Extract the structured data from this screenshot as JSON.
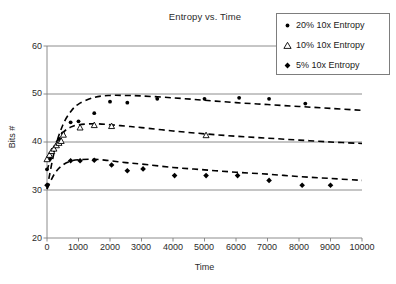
{
  "chart_data": {
    "type": "scatter",
    "title": "Entropy vs. Time",
    "xlabel": "Time",
    "ylabel": "Bits #",
    "xlim": [
      0,
      10000
    ],
    "ylim": [
      20,
      60
    ],
    "xticks": [
      0,
      1000,
      2000,
      3000,
      4000,
      5000,
      6000,
      7000,
      8000,
      9000,
      10000
    ],
    "yticks": [
      20,
      30,
      40,
      50,
      60
    ],
    "grid": "horizontal",
    "legend_position": "top-right",
    "series": [
      {
        "name": "20% 10x Entropy",
        "marker": "filled-circle",
        "points": [
          {
            "x": 0,
            "y": 34.3
          },
          {
            "x": 100,
            "y": 36.5
          },
          {
            "x": 200,
            "y": 38.2
          },
          {
            "x": 300,
            "y": 39.4
          },
          {
            "x": 400,
            "y": 40.6
          },
          {
            "x": 500,
            "y": 41.8
          },
          {
            "x": 750,
            "y": 44.1
          },
          {
            "x": 1000,
            "y": 44.3
          },
          {
            "x": 1500,
            "y": 46.0
          },
          {
            "x": 2000,
            "y": 48.4
          },
          {
            "x": 2550,
            "y": 48.2
          },
          {
            "x": 3500,
            "y": 49.0
          },
          {
            "x": 5000,
            "y": 49.0
          },
          {
            "x": 6100,
            "y": 49.2
          },
          {
            "x": 7050,
            "y": 49.0
          },
          {
            "x": 8200,
            "y": 48.0
          }
        ],
        "fit_curve": [
          {
            "x": 0,
            "y": 30.3
          },
          {
            "x": 250,
            "y": 38.5
          },
          {
            "x": 500,
            "y": 43.5
          },
          {
            "x": 750,
            "y": 46.3
          },
          {
            "x": 1000,
            "y": 47.9
          },
          {
            "x": 1500,
            "y": 49.3
          },
          {
            "x": 2000,
            "y": 49.7
          },
          {
            "x": 2500,
            "y": 49.7
          },
          {
            "x": 3000,
            "y": 49.6
          },
          {
            "x": 4000,
            "y": 49.2
          },
          {
            "x": 5000,
            "y": 48.7
          },
          {
            "x": 6000,
            "y": 48.2
          },
          {
            "x": 7000,
            "y": 47.8
          },
          {
            "x": 8000,
            "y": 47.4
          },
          {
            "x": 9000,
            "y": 47.0
          },
          {
            "x": 10000,
            "y": 46.6
          }
        ]
      },
      {
        "name": "10% 10x Entropy",
        "marker": "open-triangle",
        "points": [
          {
            "x": 0,
            "y": 36.4
          },
          {
            "x": 80,
            "y": 37.3
          },
          {
            "x": 150,
            "y": 38.1
          },
          {
            "x": 220,
            "y": 38.6
          },
          {
            "x": 300,
            "y": 39.3
          },
          {
            "x": 380,
            "y": 39.8
          },
          {
            "x": 450,
            "y": 40.2
          },
          {
            "x": 520,
            "y": 41.5
          },
          {
            "x": 1050,
            "y": 43.0
          },
          {
            "x": 1500,
            "y": 43.5
          },
          {
            "x": 2050,
            "y": 43.3
          },
          {
            "x": 5050,
            "y": 41.4
          }
        ],
        "fit_curve": [
          {
            "x": 0,
            "y": 34.0
          },
          {
            "x": 250,
            "y": 39.3
          },
          {
            "x": 500,
            "y": 41.9
          },
          {
            "x": 750,
            "y": 43.1
          },
          {
            "x": 1000,
            "y": 43.6
          },
          {
            "x": 1500,
            "y": 43.8
          },
          {
            "x": 2000,
            "y": 43.6
          },
          {
            "x": 2500,
            "y": 43.3
          },
          {
            "x": 3000,
            "y": 43.0
          },
          {
            "x": 4000,
            "y": 42.3
          },
          {
            "x": 5000,
            "y": 41.7
          },
          {
            "x": 6000,
            "y": 41.2
          },
          {
            "x": 7000,
            "y": 40.8
          },
          {
            "x": 8000,
            "y": 40.4
          },
          {
            "x": 9000,
            "y": 40.0
          },
          {
            "x": 10000,
            "y": 39.7
          }
        ]
      },
      {
        "name": "5% 10x Entropy",
        "marker": "filled-diamond",
        "points": [
          {
            "x": 0,
            "y": 31.0
          },
          {
            "x": 750,
            "y": 36.1
          },
          {
            "x": 1050,
            "y": 36.1
          },
          {
            "x": 1500,
            "y": 36.2
          },
          {
            "x": 2050,
            "y": 35.2
          },
          {
            "x": 2550,
            "y": 34.0
          },
          {
            "x": 3050,
            "y": 34.4
          },
          {
            "x": 4050,
            "y": 33.0
          },
          {
            "x": 5050,
            "y": 33.0
          },
          {
            "x": 6050,
            "y": 33.0
          },
          {
            "x": 7050,
            "y": 32.0
          },
          {
            "x": 8100,
            "y": 31.0
          },
          {
            "x": 9000,
            "y": 31.0
          }
        ],
        "fit_curve": [
          {
            "x": 0,
            "y": 30.2
          },
          {
            "x": 250,
            "y": 33.5
          },
          {
            "x": 500,
            "y": 35.2
          },
          {
            "x": 750,
            "y": 36.0
          },
          {
            "x": 1000,
            "y": 36.3
          },
          {
            "x": 1500,
            "y": 36.4
          },
          {
            "x": 2000,
            "y": 36.1
          },
          {
            "x": 2500,
            "y": 35.7
          },
          {
            "x": 3000,
            "y": 35.4
          },
          {
            "x": 4000,
            "y": 34.7
          },
          {
            "x": 5000,
            "y": 34.2
          },
          {
            "x": 6000,
            "y": 33.7
          },
          {
            "x": 7000,
            "y": 33.3
          },
          {
            "x": 8000,
            "y": 32.8
          },
          {
            "x": 9000,
            "y": 32.4
          },
          {
            "x": 10000,
            "y": 32.0
          }
        ]
      }
    ]
  },
  "legend": {
    "items": [
      {
        "label": "20% 10x Entropy",
        "marker": "filled-circle"
      },
      {
        "label": "10% 10x Entropy",
        "marker": "open-triangle"
      },
      {
        "label": "5% 10x Entropy",
        "marker": "filled-diamond"
      }
    ]
  },
  "axes": {
    "y_tick_labels": [
      "60",
      "50",
      "40",
      "30",
      "20"
    ],
    "x_tick_labels": [
      "0",
      "1000",
      "2000",
      "3000",
      "4000",
      "5000",
      "6000",
      "7000",
      "8000",
      "9000",
      "10000"
    ]
  }
}
